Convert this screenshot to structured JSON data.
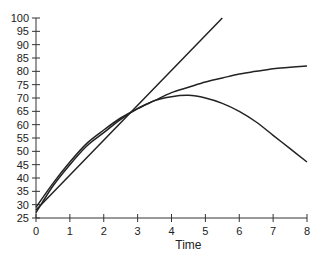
{
  "chart_data": {
    "type": "line",
    "title": "",
    "xlabel": "Time",
    "ylabel": "",
    "xlim": [
      0,
      8
    ],
    "ylim": [
      25,
      100
    ],
    "grid": false,
    "legend": null,
    "x_ticks": [
      0,
      1,
      2,
      3,
      4,
      5,
      6,
      7,
      8
    ],
    "y_ticks": [
      25,
      30,
      35,
      40,
      45,
      50,
      55,
      60,
      65,
      70,
      75,
      80,
      85,
      90,
      95,
      100
    ],
    "series": [
      {
        "name": "Tangent line",
        "x": [
          0,
          5.5
        ],
        "values": [
          28,
          100
        ]
      },
      {
        "name": "Saturating curve",
        "x": [
          0,
          0.5,
          1,
          1.5,
          2,
          2.5,
          3,
          3.5,
          4,
          4.5,
          5,
          5.5,
          6,
          6.5,
          7,
          7.5,
          8
        ],
        "values": [
          27,
          37,
          45,
          52,
          57,
          62,
          66,
          69,
          72,
          74,
          76,
          77.5,
          79,
          80,
          81,
          81.5,
          82
        ]
      },
      {
        "name": "Peaking curve",
        "x": [
          0,
          0.5,
          1,
          1.5,
          2,
          2.5,
          3,
          3.5,
          4,
          4.5,
          5,
          5.5,
          6,
          6.5,
          7,
          7.5,
          8
        ],
        "values": [
          29,
          38,
          46,
          53,
          58,
          62.5,
          66,
          69,
          70.5,
          71,
          70,
          68,
          65,
          61,
          56,
          51,
          46
        ]
      }
    ]
  }
}
